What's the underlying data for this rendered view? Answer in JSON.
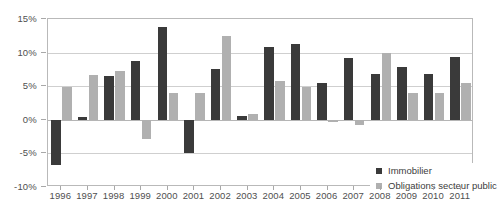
{
  "chart_data": {
    "type": "bar",
    "title": "",
    "xlabel": "",
    "ylabel": "",
    "ylim": [
      -10,
      15
    ],
    "ytick_labels": [
      "15%",
      "10%",
      "5%",
      "0%",
      "-5%",
      "-10%"
    ],
    "ytick_values": [
      15,
      10,
      5,
      0,
      -5,
      -10
    ],
    "grid": true,
    "legend_position": "bottom-right-inside",
    "categories": [
      "1996",
      "1997",
      "1998",
      "1999",
      "2000",
      "2001",
      "2002",
      "2003",
      "2004",
      "2005",
      "2006",
      "2007",
      "2008",
      "2009",
      "2010",
      "2011"
    ],
    "series": [
      {
        "name": "Immobilier",
        "color": "#3a3a3a",
        "values": [
          -6.7,
          0.4,
          6.5,
          8.7,
          13.8,
          -4.9,
          7.5,
          0.6,
          10.8,
          11.3,
          5.5,
          9.2,
          6.8,
          7.8,
          6.8,
          9.4
        ]
      },
      {
        "name": "Obligations secteur public",
        "color": "#b0b0b0",
        "values": [
          4.9,
          6.6,
          7.2,
          -2.9,
          4.0,
          4.0,
          12.5,
          0.9,
          5.8,
          4.9,
          -0.4,
          -0.7,
          10.0,
          4.0,
          4.0,
          5.5
        ]
      }
    ]
  },
  "legend": {
    "items": [
      {
        "label": "Immobilier",
        "color": "#3a3a3a"
      },
      {
        "label": "Obligations secteur public",
        "color": "#b0b0b0"
      }
    ]
  },
  "colors": {
    "series_dark": "#3a3a3a",
    "series_light": "#b0b0b0",
    "gridline": "#cfcfcf",
    "frame": "#b9b9b9",
    "text": "#4f4f4f",
    "background": "#ffffff"
  }
}
